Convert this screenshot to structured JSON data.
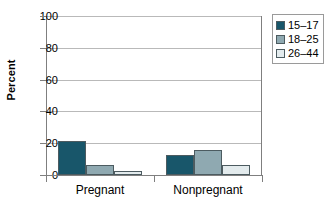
{
  "chart_data": {
    "type": "bar",
    "title": "",
    "xlabel": "",
    "ylabel": "Percent",
    "categories": [
      "Pregnant",
      "Nonpregnant"
    ],
    "series": [
      {
        "name": "15–17",
        "values": [
          21.3,
          12.5
        ],
        "color": "#18566a"
      },
      {
        "name": "18–25",
        "values": [
          6.5,
          15.5
        ],
        "color": "#8fa9b1"
      },
      {
        "name": "26–44",
        "values": [
          2.5,
          6.0
        ],
        "color": "#e3ebed"
      }
    ],
    "ylim": [
      0,
      100
    ],
    "yticks": [
      0,
      20,
      40,
      60,
      80,
      100
    ],
    "ytick_labels": [
      "0",
      "20",
      "40",
      "60",
      "80",
      "100"
    ],
    "grid": true,
    "legend_position": "right-top"
  },
  "legend": {
    "items": [
      {
        "label": "15–17",
        "color": "#18566a"
      },
      {
        "label": "18–25",
        "color": "#8fa9b1"
      },
      {
        "label": "26–44",
        "color": "#e3ebed"
      }
    ]
  },
  "axis": {
    "y_title": "Percent"
  },
  "colors": {
    "series_1": "#18566a",
    "series_2": "#8fa9b1",
    "series_3": "#e3ebed",
    "gridline": "#b9b9b9",
    "axis": "#7f7f7f",
    "bar_outline": "#4c5b60",
    "background": "#ffffff"
  }
}
